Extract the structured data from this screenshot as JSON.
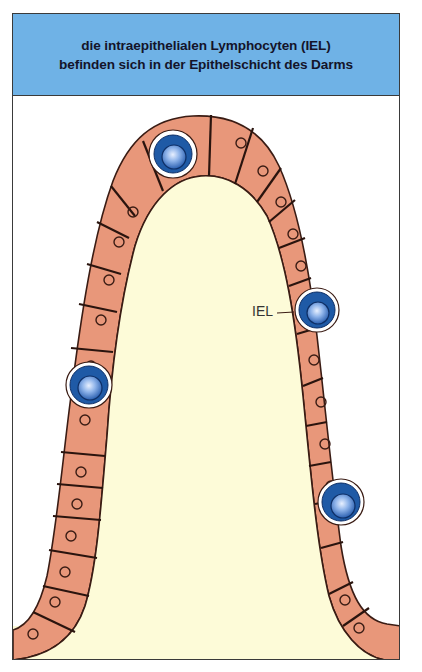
{
  "header": {
    "line1": "die intraepithelialen Lymphocyten (IEL)",
    "line2": "befinden sich in der Epithelschicht des Darms"
  },
  "diagram": {
    "iel_label": "IEL",
    "structures": [
      "villus-epithelium",
      "lamina-propria",
      "enterocyte",
      "intraepithelial-lymphocyte"
    ],
    "iel_count": 4,
    "colors": {
      "header_bg": "#6fb2e6",
      "epithelium": "#e8977a",
      "lamina_propria": "#fdfbd8",
      "outline": "#3a1c14",
      "iel_outer": "#1f5aa6",
      "iel_inner": "#6f9fe0"
    }
  }
}
